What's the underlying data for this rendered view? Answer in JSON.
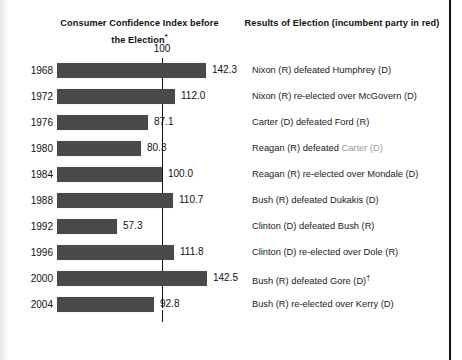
{
  "headers": {
    "left": "Consumer Confidence Index before the Election",
    "left_superscript": "*",
    "right": "Results of Election (incumbent party in red)"
  },
  "reference": {
    "label": "100",
    "value": 100
  },
  "colors": {
    "bar": "#4a4a4a",
    "incumbent_text": "#9a9a9a",
    "text": "#111111",
    "page_border": "#111111"
  },
  "rows": [
    {
      "year": "1968",
      "value": 142.3,
      "value_label": "142.3",
      "result_pre": "Nixon (R) defeated Humphrey (D)",
      "result_incumbent": "",
      "result_post": "",
      "dagger": ""
    },
    {
      "year": "1972",
      "value": 112.0,
      "value_label": "112.0",
      "result_pre": "Nixon (R) re-elected over McGovern (D)",
      "result_incumbent": "",
      "result_post": "",
      "dagger": ""
    },
    {
      "year": "1976",
      "value": 87.1,
      "value_label": "87.1",
      "result_pre": "Carter (D) defeated Ford (R)",
      "result_incumbent": "",
      "result_post": "",
      "dagger": ""
    },
    {
      "year": "1980",
      "value": 80.3,
      "value_label": "80.3",
      "result_pre": "Reagan (R) defeated ",
      "result_incumbent": "Carter (D)",
      "result_post": "",
      "dagger": ""
    },
    {
      "year": "1984",
      "value": 100.0,
      "value_label": "100.0",
      "result_pre": "Reagan (R) re-elected over Mondale (D)",
      "result_incumbent": "",
      "result_post": "",
      "dagger": ""
    },
    {
      "year": "1988",
      "value": 110.7,
      "value_label": "110.7",
      "result_pre": "Bush (R) defeated Dukakis (D)",
      "result_incumbent": "",
      "result_post": "",
      "dagger": ""
    },
    {
      "year": "1992",
      "value": 57.3,
      "value_label": "57.3",
      "result_pre": "Clinton (D) defeated Bush (R)",
      "result_incumbent": "",
      "result_post": "",
      "dagger": ""
    },
    {
      "year": "1996",
      "value": 111.8,
      "value_label": "111.8",
      "result_pre": "Clinton (D) re-elected over Dole (R)",
      "result_incumbent": "",
      "result_post": "",
      "dagger": ""
    },
    {
      "year": "2000",
      "value": 142.5,
      "value_label": "142.5",
      "result_pre": "Bush (R) defeated Gore (D)",
      "result_incumbent": "",
      "result_post": "",
      "dagger": "†"
    },
    {
      "year": "2004",
      "value": 92.8,
      "value_label": "92.8",
      "result_pre": "Bush (R) re-elected over Kerry (D)",
      "result_incumbent": "",
      "result_post": "",
      "dagger": ""
    }
  ],
  "chart_data": {
    "type": "bar",
    "title": "Consumer Confidence Index before the Election",
    "orientation": "horizontal",
    "xlabel": "",
    "ylabel": "",
    "categories": [
      "1968",
      "1972",
      "1976",
      "1980",
      "1984",
      "1988",
      "1992",
      "1996",
      "2000",
      "2004"
    ],
    "values": [
      142.3,
      112.0,
      87.1,
      80.3,
      100.0,
      110.7,
      57.3,
      111.8,
      142.5,
      92.8
    ],
    "reference_line": 100,
    "reference_line_label": "100",
    "xlim": [
      0,
      150
    ],
    "grid": false,
    "legend": null,
    "annotations": [
      "Nixon (R) defeated Humphrey (D)",
      "Nixon (R) re-elected over McGovern (D)",
      "Carter (D) defeated Ford (R)",
      "Reagan (R) defeated Carter (D)",
      "Reagan (R) re-elected over Mondale (D)",
      "Bush (R) defeated Dukakis (D)",
      "Clinton (D) defeated Bush (R)",
      "Clinton (D) re-elected over Dole (R)",
      "Bush (R) defeated Gore (D)†",
      "Bush (R) re-elected over Kerry (D)"
    ]
  },
  "scale": {
    "origin_px": 57,
    "px_per_unit": 1.05
  }
}
